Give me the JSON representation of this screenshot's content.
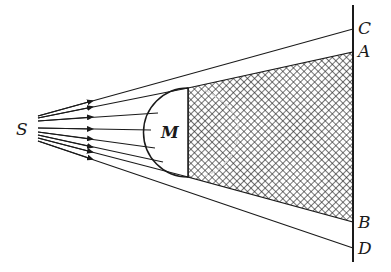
{
  "diagram": {
    "labels": {
      "source": "S",
      "object": "M",
      "screen_top_outer": "C",
      "screen_top_shadow": "A",
      "screen_bottom_shadow": "B",
      "screen_bottom_outer": "D"
    },
    "colors": {
      "line": "#1a1a1a",
      "hatch": "#2a2a2a",
      "background": "#ffffff",
      "ghost_outline": "#bdbdbd"
    },
    "rays": {
      "count": 8,
      "arrow_x": 92
    }
  }
}
